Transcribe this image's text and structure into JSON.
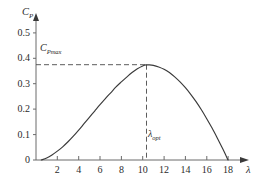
{
  "chart_data": {
    "type": "line",
    "title": "",
    "xlabel": "λ",
    "ylabel": "Cₚ",
    "ylabel_main": "C",
    "ylabel_sub": "P",
    "xlim": [
      0,
      19.4
    ],
    "ylim": [
      0,
      0.56
    ],
    "grid": false,
    "legend": null,
    "x_ticks": [
      2,
      4,
      6,
      8,
      10,
      12,
      14,
      16,
      18
    ],
    "x_tick_labels": [
      "2",
      "4",
      "6",
      "8",
      "10",
      "12",
      "14",
      "16",
      "18"
    ],
    "y_ticks": [
      0,
      0.1,
      0.2,
      0.3,
      0.4,
      0.5
    ],
    "y_tick_labels": [
      "0",
      "0.1",
      "0.2",
      "0.3",
      "0.4",
      "0.5"
    ],
    "origin_label": "0",
    "series": [
      {
        "name": "power coefficient curve",
        "x": [
          0.5,
          1.0,
          1.5,
          2.0,
          2.5,
          3.0,
          3.5,
          4.0,
          4.5,
          5.0,
          5.5,
          6.0,
          6.5,
          7.0,
          7.5,
          8.0,
          8.5,
          9.0,
          9.5,
          10.0,
          10.3,
          10.6,
          11.0,
          11.5,
          12.0,
          12.5,
          13.0,
          13.5,
          14.0,
          14.5,
          15.0,
          15.5,
          16.0,
          16.5,
          17.0,
          17.5,
          18.0
        ],
        "y": [
          0.0,
          0.008,
          0.02,
          0.035,
          0.052,
          0.072,
          0.094,
          0.118,
          0.143,
          0.168,
          0.193,
          0.218,
          0.242,
          0.265,
          0.288,
          0.308,
          0.327,
          0.345,
          0.36,
          0.371,
          0.375,
          0.375,
          0.373,
          0.367,
          0.358,
          0.345,
          0.328,
          0.308,
          0.285,
          0.259,
          0.23,
          0.198,
          0.163,
          0.126,
          0.086,
          0.044,
          0.0
        ]
      }
    ],
    "annotations": [
      {
        "name": "cp-max",
        "label_main": "C",
        "label_sub": "Pmax",
        "value": 0.375,
        "type": "horizontal-dashed-line"
      },
      {
        "name": "lambda-opt",
        "label_main": "λ",
        "label_sub": "opt",
        "value": 10.3,
        "type": "vertical-dashed-line"
      }
    ],
    "colors": {
      "curve": "#3a3a3a",
      "axis": "#6b6b6b",
      "dashed": "#4a4a4a",
      "text": "#2b2b2b",
      "background": "#ffffff"
    }
  }
}
